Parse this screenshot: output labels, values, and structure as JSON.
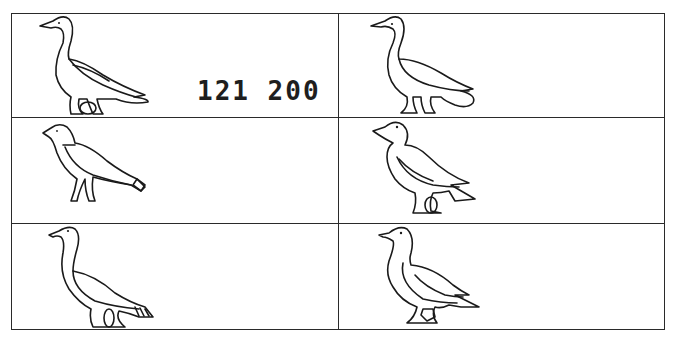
{
  "plate": {
    "rows": 3,
    "columns": 2,
    "cells": [
      {
        "position": "row-1-col-1",
        "figure": "goose-hieroglyph",
        "label": "121 200"
      },
      {
        "position": "row-1-col-2",
        "figure": "goose-hieroglyph-rounded-tail"
      },
      {
        "position": "row-2-col-1",
        "figure": "small-bird-hieroglyph"
      },
      {
        "position": "row-2-col-2",
        "figure": "duck-hieroglyph"
      },
      {
        "position": "row-3-col-1",
        "figure": "long-necked-goose-hieroglyph-striped-tail"
      },
      {
        "position": "row-3-col-2",
        "figure": "goose-hieroglyph-forked-tail"
      }
    ]
  }
}
